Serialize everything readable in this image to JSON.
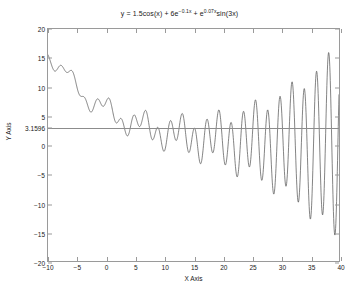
{
  "chart_data": {
    "type": "line",
    "title_parts": {
      "lead": "y = 1.5cos(x) + 6e",
      "exp1": "−0.1x",
      "mid": " + e",
      "exp2": "0.07x",
      "tail": "sin(3x)"
    },
    "xlabel": "X Axis",
    "ylabel": "Y Axis",
    "xlim": [
      -10,
      40
    ],
    "ylim": [
      -20,
      20
    ],
    "xticks": [
      -10,
      -5,
      0,
      5,
      10,
      15,
      20,
      25,
      30,
      35,
      40
    ],
    "xtick_labels": [
      "−10",
      "−5",
      "0",
      "5",
      "10",
      "15",
      "20",
      "25",
      "30",
      "35",
      "40"
    ],
    "yticks": [
      -20,
      -15,
      -10,
      -5,
      0,
      5,
      10,
      15,
      20
    ],
    "ytick_labels": [
      "−20",
      "−15",
      "−10",
      "−5",
      "0",
      "5",
      "10",
      "15",
      "20"
    ],
    "special_ytick": {
      "value": 3.1596,
      "label": "3.1596"
    },
    "grid": false,
    "legend": null,
    "series": [
      {
        "name": "y = 1.5cos(x) + 6e^-0.1x + e^0.07xsin(3x)",
        "color": "#4d4d4d",
        "linewidth": 0.7,
        "expression": {
          "term1_amp": 1.5,
          "term1_fn": "cos(x)",
          "term2_amp": 6,
          "term2_decay": -0.1,
          "term3_growth": 0.07,
          "term3_fn": "sin(3x)"
        },
        "x_start": -10,
        "x_end": 40,
        "samples": 1200
      }
    ],
    "reference_line": {
      "name": "horizontal-reference-line",
      "y": 3.1596,
      "color": "#8c8c8c",
      "orientation": "horizontal"
    }
  },
  "figure": {
    "background": "#ffffff",
    "axes_color": "#9a9a9a",
    "text_color": "#202020"
  }
}
